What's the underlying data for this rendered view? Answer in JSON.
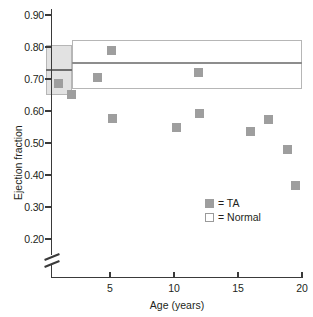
{
  "chart_data": {
    "type": "scatter",
    "title": "",
    "xlabel": "Age (years)",
    "ylabel": "Ejection fraction",
    "xlim": [
      0,
      20
    ],
    "ylim": [
      0.2,
      0.9
    ],
    "y_axis_break": true,
    "grid": false,
    "legend_position": "inside-bottom-right",
    "x_ticks": [
      5,
      10,
      15,
      20
    ],
    "x_tick_labels": [
      "5",
      "10",
      "15",
      "20"
    ],
    "y_ticks": [
      0.2,
      0.3,
      0.4,
      0.5,
      0.6,
      0.7,
      0.8,
      0.9
    ],
    "y_tick_labels": [
      "0.20",
      "0.30",
      "0.40",
      "0.50",
      "0.60",
      "0.70",
      "0.80",
      "0.90"
    ],
    "series": [
      {
        "name": "TA",
        "marker": "filled-square",
        "color": "#9e9e9e",
        "points": [
          {
            "x": 1.0,
            "y": 0.685
          },
          {
            "x": 2.0,
            "y": 0.652
          },
          {
            "x": 4.0,
            "y": 0.705
          },
          {
            "x": 5.1,
            "y": 0.79
          },
          {
            "x": 5.2,
            "y": 0.578
          },
          {
            "x": 10.2,
            "y": 0.547
          },
          {
            "x": 11.9,
            "y": 0.72
          },
          {
            "x": 12.0,
            "y": 0.592
          },
          {
            "x": 16.0,
            "y": 0.535
          },
          {
            "x": 17.4,
            "y": 0.573
          },
          {
            "x": 18.9,
            "y": 0.48
          },
          {
            "x": 19.5,
            "y": 0.367
          }
        ]
      }
    ],
    "reference_bands": [
      {
        "name": "Normal (infant)",
        "style": "filled-shaded",
        "x_range": [
          0,
          2.0
        ],
        "y_range": [
          0.65,
          0.805
        ],
        "median": 0.728,
        "fill": "#e2e2e2",
        "border": "#b6b6b6"
      },
      {
        "name": "Normal (child/adult)",
        "style": "outlined",
        "x_range": [
          2.0,
          20.0
        ],
        "y_range": [
          0.67,
          0.822
        ],
        "median": 0.75,
        "fill": "#ffffff",
        "border": "#b6b6b6"
      }
    ]
  },
  "axes": {
    "y_title": "Ejection fraction",
    "x_title": "Age (years)",
    "y_tick_labels": [
      "0.90",
      "0.80",
      "0.70",
      "0.60",
      "0.50",
      "0.40",
      "0.30",
      "0.20"
    ],
    "x_tick_labels": [
      "5",
      "10",
      "15",
      "20"
    ]
  },
  "legend": {
    "items": [
      {
        "swatch": "filled-square",
        "label": "= TA"
      },
      {
        "swatch": "outlined-square",
        "label": "= Normal"
      }
    ]
  },
  "colors": {
    "marker": "#9e9e9e",
    "band_fill": "#e2e2e2",
    "band_border": "#b6b6b6",
    "median_line": "#8d8d8d",
    "axis": "#3a3a3a",
    "text": "#231f20",
    "background": "#ffffff"
  }
}
